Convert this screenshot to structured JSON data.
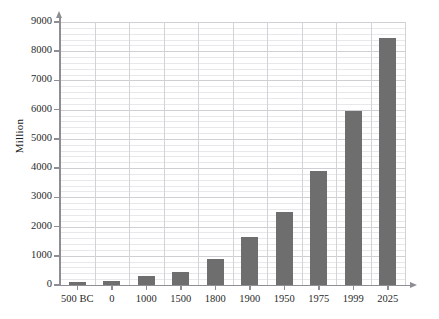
{
  "chart_data": {
    "type": "bar",
    "title": "",
    "xlabel": "",
    "ylabel": "Million",
    "categories": [
      "500 BC",
      "0",
      "1000",
      "1500",
      "1800",
      "1900",
      "1950",
      "1975",
      "1999",
      "2025"
    ],
    "values": [
      100,
      150,
      300,
      450,
      900,
      1650,
      2500,
      3900,
      5950,
      8450
    ],
    "ylim": [
      0,
      9000
    ],
    "ytick_labels": [
      "0",
      "1000",
      "2000",
      "3000",
      "4000",
      "5000",
      "6000",
      "7000",
      "8000",
      "9000"
    ],
    "ytick_values": [
      0,
      1000,
      2000,
      3000,
      4000,
      5000,
      6000,
      7000,
      8000,
      9000
    ],
    "minor_tick_step": 200,
    "grid": true,
    "legend": null,
    "legend_position": "none",
    "bar_color": "#6e6e6e",
    "grid_color": "#e8e8ea",
    "grid_major_color": "#cfcfd4",
    "axis_color": "#8d8d93",
    "background": "#ffffff"
  }
}
